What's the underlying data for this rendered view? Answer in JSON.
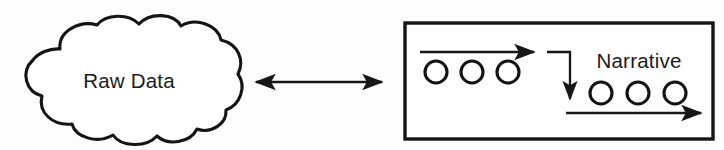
{
  "diagram": {
    "type": "flow-diagram",
    "title_visible": false,
    "background_color": "#fdfdfd",
    "stroke_color": "#171717",
    "nodes": {
      "cloud": {
        "shape": "cloud",
        "label": "Raw Data",
        "label_x": 129,
        "label_y": 88,
        "bounds": {
          "x": 18,
          "y": 20,
          "width": 224,
          "height": 126
        }
      },
      "process_box": {
        "shape": "rectangle",
        "bounds": {
          "x": 405,
          "y": 23,
          "width": 308,
          "height": 116
        },
        "label": "Narrative",
        "label_x": 639,
        "label_y": 68
      }
    },
    "connector": {
      "name": "bidirectional-arrow",
      "style": "double-headed",
      "from_x": 246,
      "to_x": 392,
      "y": 82
    },
    "token_groups": [
      {
        "name": "input-tokens",
        "count": 3,
        "radius": 11,
        "cy": 72,
        "cxs": [
          436,
          472,
          508
        ]
      },
      {
        "name": "output-tokens",
        "count": 3,
        "radius": 11,
        "cy": 93,
        "cxs": [
          601,
          638,
          675
        ]
      }
    ],
    "flow_arrows": [
      {
        "name": "top-flow-arrow",
        "direction": "right",
        "x1": 420,
        "x2": 543,
        "y": 52
      },
      {
        "name": "elbow-connector",
        "direction": "down",
        "corner_x": 570,
        "y_top": 52,
        "y_bottom": 108,
        "start_x": 547
      },
      {
        "name": "bottom-flow-arrow",
        "direction": "right",
        "x1": 566,
        "x2": 710,
        "y": 113
      }
    ]
  },
  "labels": {
    "raw_data": "Raw Data",
    "narrative": "Narrative"
  }
}
